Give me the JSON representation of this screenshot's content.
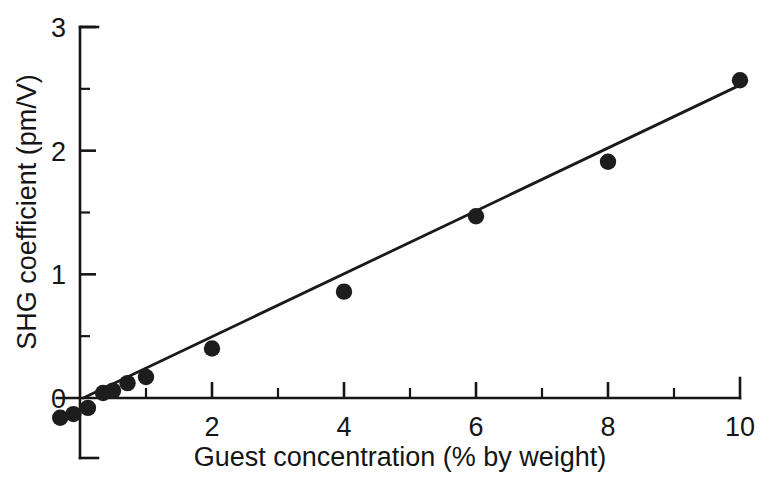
{
  "chart_data": {
    "type": "scatter",
    "title": "",
    "xlabel": "Guest concentration (% by weight)",
    "ylabel": "SHG coefficient (pm/V)",
    "xlim": [
      -0.35,
      10.0
    ],
    "ylim": [
      -0.25,
      3.0
    ],
    "grid": false,
    "legend": null,
    "x_major_ticks": [
      2,
      4,
      6,
      8,
      10
    ],
    "x_major_tick_labels": [
      "2",
      "4",
      "6",
      "8",
      "10"
    ],
    "x_minor_ticks": [
      1,
      3,
      5,
      7,
      9
    ],
    "y_major_ticks": [
      0,
      1,
      2,
      3
    ],
    "y_major_tick_labels": [
      "0",
      "1",
      "2",
      "3"
    ],
    "y_minor_ticks": [
      0.5,
      1.5,
      2.5
    ],
    "series": [
      {
        "name": "SHG coefficient vs guest concentration",
        "marker": "filled-circle",
        "x": [
          -0.3,
          -0.1,
          0.12,
          0.35,
          0.5,
          0.72,
          1.0,
          2.0,
          4.0,
          6.0,
          8.0,
          10.0
        ],
        "y": [
          -0.16,
          -0.13,
          -0.08,
          0.04,
          0.06,
          0.12,
          0.17,
          0.4,
          0.86,
          1.47,
          1.91,
          2.57
        ]
      }
    ],
    "fit_line": {
      "name": "linear fit",
      "x": [
        0.05,
        10.0
      ],
      "y": [
        0.0,
        2.53
      ]
    },
    "colors": {
      "marker": "#1d1d1d",
      "line": "#1a1a1a",
      "axis": "#161616",
      "text": "#151515",
      "background": "#ffffff"
    }
  }
}
